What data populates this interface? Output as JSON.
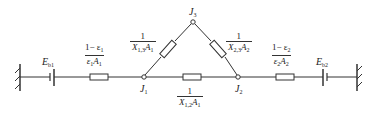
{
  "diagram": {
    "type": "radiation-network",
    "colors": {
      "line": "#333333",
      "background": "#ffffff",
      "text": "#222222"
    },
    "nodes": [
      {
        "id": "J1",
        "label": "J",
        "sub": "1"
      },
      {
        "id": "J2",
        "label": "J",
        "sub": "2"
      },
      {
        "id": "J3",
        "label": "J",
        "sub": "3"
      }
    ],
    "sources": [
      {
        "id": "Eb1",
        "label": "E",
        "sub": "b1"
      },
      {
        "id": "Eb2",
        "label": "E",
        "sub": "b2"
      }
    ],
    "resistances": {
      "surface1": {
        "num": "1− ε",
        "num_sub": "1",
        "den": "ε",
        "den_sub": "1",
        "den_tail": "A",
        "den_tail_sub": "1"
      },
      "surface2": {
        "num": "1− ε",
        "num_sub": "2",
        "den": "ε",
        "den_sub": "2",
        "den_tail": "A",
        "den_tail_sub": "2"
      },
      "space13": {
        "num": "1",
        "den": "X",
        "den_sub": "1,3",
        "den_tail": "A",
        "den_tail_sub": "1"
      },
      "space23": {
        "num": "1",
        "den": "X",
        "den_sub": "2,3",
        "den_tail": "A",
        "den_tail_sub": "2"
      },
      "space12": {
        "num": "1",
        "den": "X",
        "den_sub": "1,2",
        "den_tail": "A",
        "den_tail_sub": "1"
      }
    }
  }
}
